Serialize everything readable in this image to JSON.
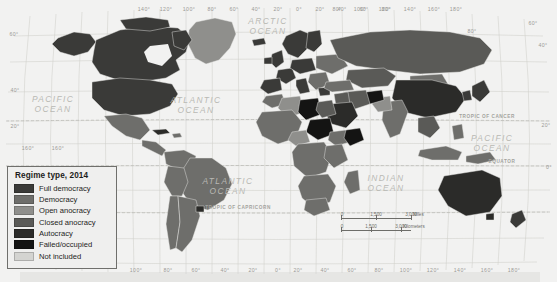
{
  "map": {
    "title": "Regime type, 2014",
    "background_color": "#f2f2f1",
    "graticule_color": "#c9c9c4"
  },
  "legend": {
    "title": "Regime type, 2014",
    "items": [
      {
        "label": "Full democracy",
        "color": "#3a3a38"
      },
      {
        "label": "Democracy",
        "color": "#6e6e6b"
      },
      {
        "label": "Open anocracy",
        "color": "#8f8f8c"
      },
      {
        "label": "Closed anocracy",
        "color": "#5a5a57"
      },
      {
        "label": "Autocracy",
        "color": "#2b2b29"
      },
      {
        "label": "Failed/occupied",
        "color": "#141413"
      },
      {
        "label": "Not included",
        "color": "#d4d4d1"
      }
    ]
  },
  "ocean_labels": [
    {
      "name": "arctic-ocean",
      "line1": "ARCTIC",
      "line2": "OCEAN",
      "x": 268,
      "y": 24
    },
    {
      "name": "pacific-ocean-west",
      "line1": "PACIFIC",
      "line2": "OCEAN",
      "x": 53,
      "y": 102
    },
    {
      "name": "atlantic-ocean-north",
      "line1": "ATLANTIC",
      "line2": "OCEAN",
      "x": 196,
      "y": 103
    },
    {
      "name": "atlantic-ocean-south",
      "line1": "ATLANTIC",
      "line2": "OCEAN",
      "x": 228,
      "y": 184
    },
    {
      "name": "indian-ocean",
      "line1": "INDIAN",
      "line2": "OCEAN",
      "x": 386,
      "y": 181
    },
    {
      "name": "pacific-ocean-east",
      "line1": "PACIFIC",
      "line2": "OCEAN",
      "x": 492,
      "y": 141
    }
  ],
  "reference_lines": [
    {
      "name": "tropic-of-cancer",
      "label": "TROPIC OF CANCER",
      "x": 487,
      "y": 118,
      "line_y": 121
    },
    {
      "name": "equator",
      "label": "EQUATOR",
      "x": 502,
      "y": 163,
      "line_y": 166
    },
    {
      "name": "tropic-of-capricorn",
      "label": "TROPIC OF CAPRICORN",
      "x": 238,
      "y": 209,
      "line_y": 212
    }
  ],
  "longitude_labels_top": [
    {
      "text": "140°",
      "x": 144
    },
    {
      "text": "120°",
      "x": 166
    },
    {
      "text": "100°",
      "x": 189
    },
    {
      "text": "80°",
      "x": 212
    },
    {
      "text": "60°",
      "x": 234
    },
    {
      "text": "40°",
      "x": 256
    },
    {
      "text": "20°",
      "x": 278
    },
    {
      "text": "0°",
      "x": 299
    },
    {
      "text": "20°",
      "x": 320
    },
    {
      "text": "40°",
      "x": 342
    },
    {
      "text": "60°",
      "x": 364
    },
    {
      "text": "80°",
      "x": 386
    },
    {
      "text": "80°",
      "x": 337
    },
    {
      "text": "100°",
      "x": 360
    },
    {
      "text": "120°",
      "x": 385
    },
    {
      "text": "140°",
      "x": 410
    },
    {
      "text": "160°",
      "x": 434
    },
    {
      "text": "180°",
      "x": 456
    }
  ],
  "longitude_labels_bottom": [
    {
      "text": "100°",
      "x": 136
    },
    {
      "text": "80°",
      "x": 168
    },
    {
      "text": "60°",
      "x": 196
    },
    {
      "text": "40°",
      "x": 225
    },
    {
      "text": "20°",
      "x": 253
    },
    {
      "text": "0°",
      "x": 278
    },
    {
      "text": "20°",
      "x": 298
    },
    {
      "text": "40°",
      "x": 325
    },
    {
      "text": "60°",
      "x": 352
    },
    {
      "text": "80°",
      "x": 379
    },
    {
      "text": "100°",
      "x": 406
    },
    {
      "text": "120°",
      "x": 433
    },
    {
      "text": "140°",
      "x": 460
    },
    {
      "text": "160°",
      "x": 487
    },
    {
      "text": "180°",
      "x": 514
    }
  ],
  "latitude_labels_left": [
    {
      "text": "60°",
      "x": 8,
      "y": 36
    },
    {
      "text": "40°",
      "x": 9,
      "y": 92
    },
    {
      "text": "20°",
      "x": 9,
      "y": 128
    },
    {
      "text": "160°",
      "x": 22,
      "y": 150
    },
    {
      "text": "160°",
      "x": 52,
      "y": 150
    }
  ],
  "latitude_labels_right": [
    {
      "text": "60°",
      "x": 527,
      "y": 25
    },
    {
      "text": "40°",
      "x": 537,
      "y": 47
    },
    {
      "text": "20°",
      "x": 540,
      "y": 127
    },
    {
      "text": "0°",
      "x": 543,
      "y": 169
    },
    {
      "text": "80°",
      "x": 466,
      "y": 33
    }
  ],
  "scalebar": {
    "miles": {
      "unit": "Miles",
      "ticks": [
        "0",
        "1,500",
        "3,000"
      ]
    },
    "kilometers": {
      "unit": "Kilometers",
      "ticks": [
        "0",
        "1,500",
        "3,000"
      ]
    }
  }
}
